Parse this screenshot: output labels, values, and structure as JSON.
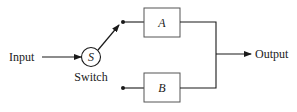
{
  "diagram": {
    "input_label": "Input",
    "switch_symbol": "S",
    "switch_label": "Switch",
    "block_a_label": "A",
    "block_b_label": "B",
    "output_label": "Output",
    "colors": {
      "line": "#1a1a1a",
      "box_border": "#555555",
      "background": "#ffffff"
    }
  }
}
